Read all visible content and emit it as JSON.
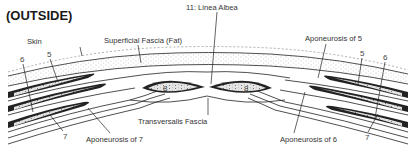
{
  "title": "(OUTSIDE)",
  "labels": {
    "skin": "Skin",
    "superficial_fascia": "Superficial Fascia (Fat)",
    "linea_alba": "11: Linea Albea",
    "aponeurosis_5": "Aponeurosis of 5",
    "aponeurosis_6": "Aponeurosis of 6",
    "aponeurosis_7": "Aponeurosis of 7",
    "transversalis_fascia": "Transversalis Fascia"
  },
  "numbers": {
    "left_5": "5",
    "left_6": "6",
    "left_7": "7",
    "right_5": "5",
    "right_6": "6",
    "right_7": "7",
    "rectus_left": "8",
    "rectus_right": "8"
  }
}
